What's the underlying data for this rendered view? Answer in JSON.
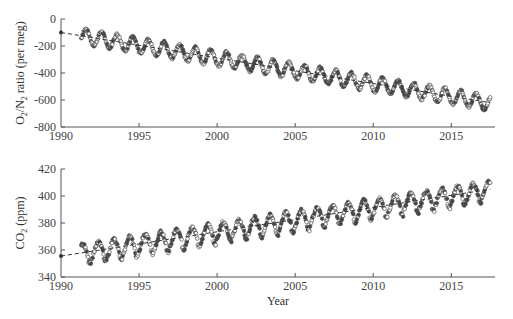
{
  "chart_data": [
    {
      "type": "scatter",
      "title": "",
      "xlabel": "",
      "ylabel": "O2/N2 ratio (per meg)",
      "ylabel_parts": {
        "pre": "O",
        "sub1": "2",
        "mid": "/N",
        "sub2": "2",
        "post": " ratio (per meg)"
      },
      "xlim": [
        1990,
        2017.8
      ],
      "ylim": [
        -800,
        0
      ],
      "xticks": [
        1990,
        1995,
        2000,
        2005,
        2010,
        2015
      ],
      "yticks": [
        0,
        -200,
        -400,
        -600,
        -800
      ],
      "grid": false,
      "legend": null,
      "trend": {
        "style": "dashed",
        "x": [
          1990,
          2017.5
        ],
        "y": [
          -100,
          -620
        ]
      },
      "seasonal": {
        "start": 1991.3,
        "end": 2017.5,
        "amplitude": 55,
        "phase_peak": 0.6,
        "intercept_1990": -100,
        "slope": -19.0
      },
      "series": [
        {
          "name": "observations",
          "marker": "circle",
          "note": "seasonal oscillation superimposed on declining trend; peaks ~-80 (1992) to ~-560 (2017), troughs ~-200 (1992) to ~-700 (2017)"
        }
      ]
    },
    {
      "type": "scatter",
      "title": "",
      "xlabel": "Year",
      "ylabel": "CO2 (ppm)",
      "ylabel_parts": {
        "pre": "CO",
        "sub1": "2",
        "post": " (ppm)"
      },
      "xlim": [
        1990,
        2017.8
      ],
      "ylim": [
        340,
        420
      ],
      "xticks": [
        1990,
        1995,
        2000,
        2005,
        2010,
        2015
      ],
      "yticks": [
        420,
        400,
        380,
        360,
        340
      ],
      "grid": false,
      "legend": null,
      "trend": {
        "style": "dashed",
        "x": [
          1990,
          2017.5
        ],
        "y": [
          355.5,
          405
        ]
      },
      "seasonal": {
        "start": 1991.3,
        "end": 2017.5,
        "amplitude": 7,
        "intercept_1990": 355.5,
        "slope": 1.8
      },
      "series": [
        {
          "name": "observations",
          "marker": "circle",
          "note": "sawtooth seasonal cycle on rising trend; maxima ~362 (1992) to ~414 (2017), minima ~347 (1992) to ~396 (2017)"
        }
      ]
    }
  ],
  "labels": {
    "top_ylabel_pre": "O",
    "top_ylabel_sub1": "2",
    "top_ylabel_mid": "/N",
    "top_ylabel_sub2": "2",
    "top_ylabel_post": " ratio (per meg)",
    "bottom_ylabel_pre": "CO",
    "bottom_ylabel_sub": "2",
    "bottom_ylabel_post": " (ppm)",
    "xlabel": "Year"
  }
}
